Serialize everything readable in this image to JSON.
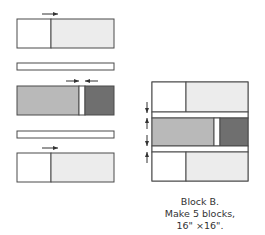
{
  "colors": {
    "outline": "#4a4a4a",
    "white_fabric": "#ffffff",
    "light_fabric": "#ececec",
    "medium_fabric": "#b9b9b9",
    "dark_fabric": "#6f6f6f",
    "arrow": "#333333"
  },
  "components": [
    {
      "id": "unit-top",
      "pieces": [
        "white",
        "light"
      ],
      "pressing_arrow": "right"
    },
    {
      "id": "strip-1",
      "pieces": [
        "white"
      ]
    },
    {
      "id": "unit-middle",
      "pieces": [
        "medium",
        "white",
        "dark"
      ],
      "pressing_arrow": "inward"
    },
    {
      "id": "strip-2",
      "pieces": [
        "white"
      ]
    },
    {
      "id": "unit-bottom",
      "pieces": [
        "white",
        "light"
      ],
      "pressing_arrow": "right"
    }
  ],
  "caption": {
    "line1": "Block B.",
    "line2": "Make 5 blocks,",
    "line3": "16\" ×16\"."
  }
}
